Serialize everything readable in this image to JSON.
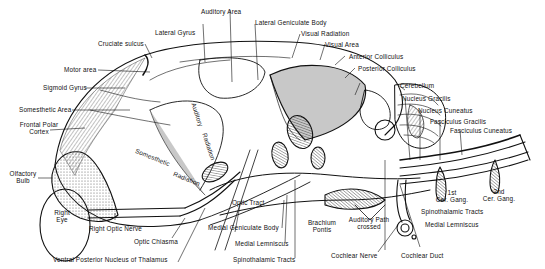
{
  "diagram": {
    "type": "anatomical-illustration",
    "colors": {
      "ink": "#111111",
      "background": "#ffffff",
      "hatch": "#333333"
    },
    "labels": {
      "cruciate_sulcus": "Cruciate sulcus",
      "lateral_gyrus": "Lateral Gyrus",
      "auditory_area": "Auditory Area",
      "lateral_geniculate_body": "Lateral Geniculate Body",
      "visual_radiation": "Visual Radiation",
      "visual_area": "Visual Area",
      "anterior_colliculus": "Anterior Colliculus",
      "posterior_colliculus": "Posterior Colliculus",
      "cerebellum": "Cerebellum",
      "nucleus_gracilis": "Nucleus Gracilis",
      "nucleus_cuneatus": "Nucleus Cuneatus",
      "fasciculus_gracilis": "Fasciculus Gracilis",
      "fasciculus_cuneatus": "Fasciculus Cuneatus",
      "motor_area": "Motor area",
      "sigmoid_gyrus": "Sigmoid Gyrus",
      "somesthetic_area": "Somesthetic Area",
      "frontal_polar_cortex_1": "Frontal Polar",
      "frontal_polar_cortex_2": "Cortex",
      "olfactory_bulb_1": "Olfactory",
      "olfactory_bulb_2": "Bulb",
      "right_eye_1": "Right",
      "right_eye_2": "Eye",
      "right_optic_nerve": "Right Optic Nerve",
      "optic_chiasma": "Optic Chiasma",
      "ventral_posterior_nucleus": "Ventral Posterior Nucleus of Thalamus",
      "somesthetic_radiation_1": "Somesthetic",
      "somesthetic_radiation_2": "Radiation",
      "auditory_radiation_1": "Auditory",
      "auditory_radiation_2": "Radiation",
      "optic_tract": "Optic Tract",
      "medial_geniculate_body": "Medial Geniculate Body",
      "medial_lemniscus_center": "Medial Lemniscus",
      "spinothalamic_tracts_center": "Spinothalamic Tracts",
      "brachium_pontis_1": "Brachium",
      "brachium_pontis_2": "Pontis",
      "auditory_path_1": "Auditory Path",
      "auditory_path_2": "crossed",
      "cochlear_nerve": "Cochlear Nerve",
      "cochlear_duct": "Cochlear Duct",
      "spinothalamic_tracts_right": "Spinothalamic Tracts",
      "medial_lemniscus_right": "Medial Lemniscus",
      "first_cer_gang_1": "1st",
      "first_cer_gang_2": "Cer. Gang.",
      "second_cer_gang_1": "2nd",
      "second_cer_gang_2": "Cer. Gang."
    }
  }
}
